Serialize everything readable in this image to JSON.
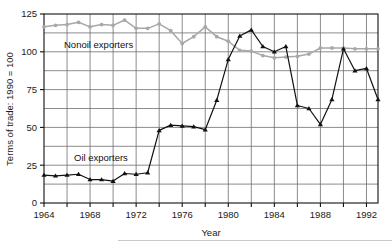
{
  "chart_data": {
    "type": "line",
    "title": "",
    "xlabel": "Year",
    "ylabel": "Terms of trade: 1990 = 100",
    "xlim": [
      1964,
      1993
    ],
    "ylim": [
      0,
      125
    ],
    "grid": true,
    "x_tick_labels": [
      "1964",
      "1968",
      "1972",
      "1976",
      "1980",
      "1984",
      "1988",
      "1992"
    ],
    "x_ticks": [
      1964,
      1968,
      1972,
      1976,
      1980,
      1984,
      1988,
      1992
    ],
    "x_gridlines": [
      1964,
      1966,
      1968,
      1970,
      1972,
      1974,
      1976,
      1978,
      1980,
      1982,
      1984,
      1986,
      1988,
      1990,
      1992
    ],
    "y_tick_labels": [
      "0",
      "25",
      "50",
      "75",
      "100",
      "125"
    ],
    "y_ticks": [
      0,
      25,
      50,
      75,
      100,
      125
    ],
    "y_gridlines": [
      12.5,
      25,
      37.5,
      50,
      62.5,
      75,
      87.5,
      100,
      112.5
    ],
    "legend_position": "inline-annotation",
    "x": [
      1964,
      1965,
      1966,
      1967,
      1968,
      1969,
      1970,
      1971,
      1972,
      1973,
      1974,
      1975,
      1976,
      1977,
      1978,
      1979,
      1980,
      1981,
      1982,
      1983,
      1984,
      1985,
      1986,
      1987,
      1988,
      1989,
      1990,
      1991,
      1992,
      1993
    ],
    "series": [
      {
        "name": "Nonoil exporters",
        "color": "#a8a8a8",
        "marker": "circle",
        "label_text": "Nonoil exporters",
        "values": [
          116.5,
          117.5,
          118.0,
          119.5,
          116.5,
          118.0,
          117.5,
          121.0,
          115.5,
          115.5,
          118.5,
          114.0,
          105.5,
          110.0,
          116.5,
          110.0,
          107.0,
          101.0,
          100.5,
          97.5,
          96.0,
          96.5,
          97.0,
          98.5,
          102.5,
          102.5,
          102.5,
          102.0,
          102.0,
          102.0
        ]
      },
      {
        "name": "Oil exporters",
        "color": "#111111",
        "marker": "triangle",
        "label_text": "Oil exporters",
        "values": [
          18.5,
          18.0,
          18.5,
          19.0,
          15.5,
          15.5,
          14.5,
          19.5,
          19.0,
          20.0,
          48.0,
          51.5,
          51.0,
          50.5,
          48.5,
          68.0,
          95.0,
          110.5,
          114.5,
          103.5,
          100.0,
          103.5,
          64.5,
          62.5,
          52.0,
          68.5,
          102.0,
          87.5,
          89.0,
          68.5
        ]
      }
    ]
  },
  "chart_meta": {
    "axis_color": "#111111",
    "grid_color": "#6e6e6e",
    "background": "#ffffff",
    "footer_rule_color": "#c9c9c9"
  }
}
